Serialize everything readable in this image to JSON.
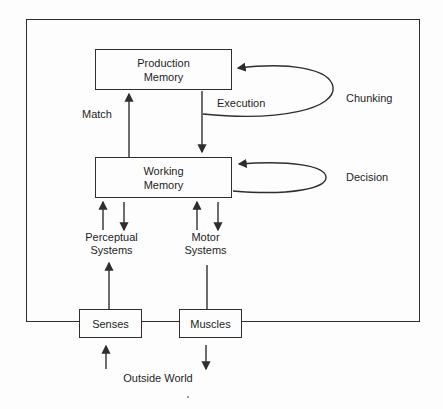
{
  "diagram": {
    "nodes": {
      "production_memory": {
        "lines": [
          "Production",
          "Memory"
        ]
      },
      "working_memory": {
        "lines": [
          "Working",
          "Memory"
        ]
      },
      "perceptual_systems": {
        "lines": [
          "Perceptual",
          "Systems"
        ]
      },
      "motor_systems": {
        "lines": [
          "Motor",
          "Systems"
        ]
      },
      "senses": {
        "label": "Senses"
      },
      "muscles": {
        "label": "Muscles"
      },
      "outside_world": {
        "label": "Outside World"
      }
    },
    "edges": [
      {
        "from": "working_memory",
        "to": "production_memory",
        "label": "Match"
      },
      {
        "from": "production_memory",
        "to": "working_memory",
        "label": "Execution"
      },
      {
        "from": "production_memory",
        "to": "production_memory",
        "label": "Chunking",
        "type": "self-loop"
      },
      {
        "from": "working_memory",
        "to": "working_memory",
        "label": "Decision",
        "type": "self-loop"
      },
      {
        "from": "perceptual_systems",
        "to": "working_memory",
        "label": ""
      },
      {
        "from": "working_memory",
        "to": "perceptual_systems",
        "label": ""
      },
      {
        "from": "motor_systems",
        "to": "working_memory",
        "label": ""
      },
      {
        "from": "working_memory",
        "to": "motor_systems",
        "label": ""
      },
      {
        "from": "senses",
        "to": "perceptual_systems",
        "label": ""
      },
      {
        "from": "motor_systems",
        "to": "muscles",
        "label": ""
      },
      {
        "from": "outside_world",
        "to": "senses",
        "label": ""
      },
      {
        "from": "muscles",
        "to": "outside_world",
        "label": ""
      }
    ],
    "colors": {
      "line": "#2e2e2e",
      "text": "#1d1d1d",
      "background": "#fdfdfd"
    }
  }
}
